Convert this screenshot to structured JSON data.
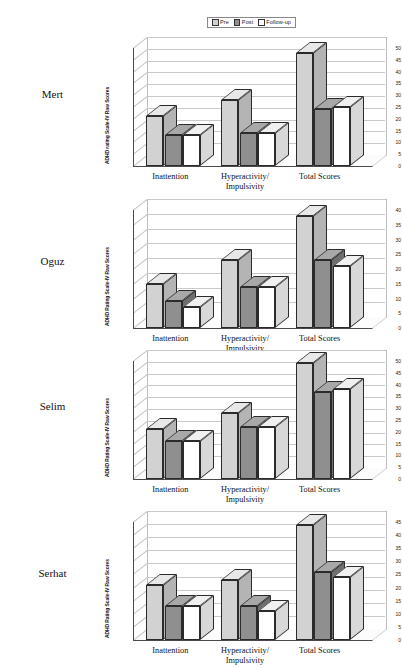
{
  "legend": {
    "items": [
      {
        "label": "Pre",
        "color": "#d2d2d2",
        "swatch_name": "legend-swatch-pre"
      },
      {
        "label": "Post",
        "color": "#8f8f8f",
        "swatch_name": "legend-swatch-post"
      },
      {
        "label": "Follow-up",
        "color": "#ffffff",
        "swatch_name": "legend-swatch-followup"
      }
    ]
  },
  "colors": {
    "pre": "#d2d2d2",
    "post": "#8f8f8f",
    "followup": "#ffffff",
    "pre_top": "#e8e8e8",
    "post_top": "#a8a8a8",
    "followup_top": "#f0f0f0",
    "pre_side": "#b4b4b4",
    "post_side": "#6e6e6e",
    "followup_side": "#d8d8d8",
    "outline": "#2b2b2b",
    "grid": "#c9c9c9",
    "axis": "#4a4a4a"
  },
  "subjects": [
    {
      "name": "Mert"
    },
    {
      "name": "Oguz"
    },
    {
      "name": "Selim"
    },
    {
      "name": "Serhat"
    }
  ],
  "chart_data": [
    {
      "type": "bar",
      "title": "Mert",
      "categories": [
        "Inattention",
        "Hyperactivity/ Impulsivity",
        "Total Scores"
      ],
      "category_lines": [
        [
          "Inattention"
        ],
        [
          "Hyperactivity/",
          "Impulsivity"
        ],
        [
          "Total Scores"
        ]
      ],
      "series": [
        {
          "name": "Pre",
          "values": [
            21,
            28,
            48
          ]
        },
        {
          "name": "Post",
          "values": [
            13,
            14,
            24
          ]
        },
        {
          "name": "Follow-up",
          "values": [
            13,
            14,
            25
          ]
        }
      ],
      "xlabel": "",
      "ylabel": "ADHD rating Scale-IV Raw Scores",
      "ylim": [
        0,
        50
      ],
      "ytick_step": 5,
      "yticks": [
        0,
        5,
        10,
        15,
        20,
        25,
        30,
        35,
        40,
        45,
        50
      ],
      "grid": true,
      "legend_position": "top"
    },
    {
      "type": "bar",
      "title": "Oguz",
      "categories": [
        "Inattention",
        "Hyperactivity/ Impulsivity",
        "Total Scores"
      ],
      "category_lines": [
        [
          "Inattention"
        ],
        [
          "Hyperactivity/",
          "Impulsivity"
        ],
        [
          "Total Scores"
        ]
      ],
      "series": [
        {
          "name": "Pre",
          "values": [
            15,
            23,
            38
          ]
        },
        {
          "name": "Post",
          "values": [
            9,
            14,
            23
          ]
        },
        {
          "name": "Follow-up",
          "values": [
            7,
            14,
            21
          ]
        }
      ],
      "xlabel": "",
      "ylabel": "ADHD Rating Scale-IV Raw Scores",
      "ylim": [
        0,
        40
      ],
      "ytick_step": 5,
      "yticks": [
        0,
        5,
        10,
        15,
        20,
        25,
        30,
        35,
        40
      ],
      "grid": true,
      "legend_position": "top"
    },
    {
      "type": "bar",
      "title": "Selim",
      "categories": [
        "Inattention",
        "Hyperactivity/ Impulsivity",
        "Total Scores"
      ],
      "category_lines": [
        [
          "Inattention"
        ],
        [
          "Hyperactivity/",
          "Impulsivity"
        ],
        [
          "Total Scores"
        ]
      ],
      "series": [
        {
          "name": "Pre",
          "values": [
            21,
            28,
            49
          ]
        },
        {
          "name": "Post",
          "values": [
            16,
            22,
            37
          ]
        },
        {
          "name": "Follow-up",
          "values": [
            16,
            22,
            38
          ]
        }
      ],
      "xlabel": "",
      "ylabel": "ADHD Rating Scale-IV Raw Scores",
      "ylim": [
        0,
        50
      ],
      "ytick_step": 5,
      "yticks": [
        0,
        5,
        10,
        15,
        20,
        25,
        30,
        35,
        40,
        45,
        50
      ],
      "grid": true,
      "legend_position": "top"
    },
    {
      "type": "bar",
      "title": "Serhat",
      "categories": [
        "Inattention",
        "Hyperactivity/ Impulsivity",
        "Total Scores"
      ],
      "category_lines": [
        [
          "Inattention"
        ],
        [
          "Hyperactivity/",
          "Impulsivity"
        ],
        [
          "Total Scores"
        ]
      ],
      "series": [
        {
          "name": "Pre",
          "values": [
            21,
            23,
            44
          ]
        },
        {
          "name": "Post",
          "values": [
            13,
            13,
            26
          ]
        },
        {
          "name": "Follow-up",
          "values": [
            13,
            11,
            24
          ]
        }
      ],
      "xlabel": "",
      "ylabel": "ADHD Rating Scale-IV Raw Scores",
      "ylim": [
        0,
        45
      ],
      "ytick_step": 5,
      "yticks": [
        0,
        5,
        10,
        15,
        20,
        25,
        30,
        35,
        40,
        45
      ],
      "grid": true,
      "legend_position": "top"
    }
  ]
}
